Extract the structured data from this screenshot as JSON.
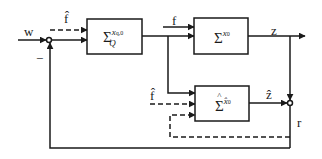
{
  "diagram": {
    "type": "feedback block diagram",
    "colors": {
      "line": "#1a1a1a",
      "background": "#ffffff"
    },
    "signals": {
      "input": "w",
      "fault": "f",
      "fault_estimate_top": "f̂",
      "fault_estimate_bottom": "f̂",
      "output": "z",
      "estimated_output": "ẑ",
      "residual": "r",
      "minus_sign": "−"
    },
    "blocks": [
      {
        "id": "controller",
        "symbol": "Σ",
        "subscript": "Q",
        "superscript": "x_{q,0}"
      },
      {
        "id": "plant",
        "symbol": "Σ",
        "superscript": "x₀"
      },
      {
        "id": "observer",
        "symbol": "Σ̂",
        "superscript": "x̂₀"
      }
    ],
    "labels": {
      "controller_super": "x",
      "controller_super_sub": "q,0",
      "controller_sub": "Q",
      "plant_super": "x",
      "plant_super_sub": "0",
      "observer_super": "x̂",
      "observer_super_sub": "0",
      "sigma": "Σ"
    }
  }
}
